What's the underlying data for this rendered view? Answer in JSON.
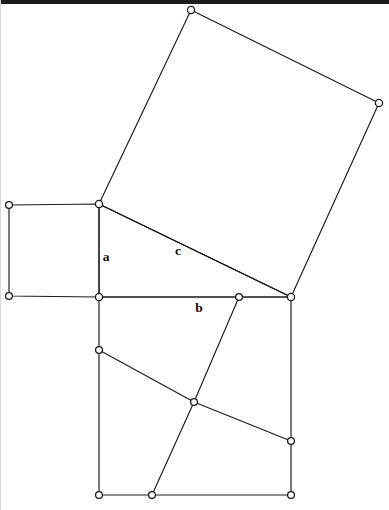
{
  "figure": {
    "canvas": {
      "width": 389,
      "height": 510,
      "background": "#ffffff"
    },
    "stroke_color": "#1b1b1b",
    "vertex_fill": "#ffffff",
    "label_color": "#101010",
    "scan_artifact": {
      "name": "top-dark-strip",
      "color": "#1d1d1d",
      "height": 4
    }
  },
  "labels": {
    "a": {
      "text": "a",
      "x": 106,
      "y": 258
    },
    "b": {
      "text": "b",
      "x": 199,
      "y": 309
    },
    "c": {
      "text": "c",
      "x": 178,
      "y": 252
    }
  },
  "points": {
    "T_apex": {
      "x": 99,
      "y": 204
    },
    "T_right_angle": {
      "x": 99,
      "y": 297
    },
    "T_far": {
      "x": 291,
      "y": 297
    },
    "A_tl": {
      "x": 9,
      "y": 205
    },
    "A_bl": {
      "x": 9,
      "y": 296
    },
    "C_top": {
      "x": 191,
      "y": 10
    },
    "C_right": {
      "x": 379,
      "y": 103
    },
    "B_bl": {
      "x": 99,
      "y": 495
    },
    "B_br": {
      "x": 291,
      "y": 495
    },
    "B_center": {
      "x": 194,
      "y": 402
    },
    "B_left_mid": {
      "x": 99,
      "y": 350
    },
    "B_top_mid": {
      "x": 239,
      "y": 297
    },
    "B_right_mid": {
      "x": 291,
      "y": 441
    },
    "B_bottom_mid": {
      "x": 152,
      "y": 495
    }
  },
  "shapes": {
    "square_a": {
      "name": "square-on-leg-a",
      "path": "M 9 205 L 99 204 L 99 297 L 9 296 Z"
    },
    "square_c": {
      "name": "square-on-hypotenuse-c",
      "path": "M 99 204 L 191 10 L 379 103 L 291 297 Z"
    },
    "square_b": {
      "name": "square-on-leg-b",
      "path": "M 99 297 L 291 297 L 291 495 L 99 495 Z"
    },
    "triangle": {
      "name": "right-triangle",
      "path": "M 99 204 L 99 297 L 291 297 Z"
    },
    "dissection_line_1": {
      "name": "perigal-cut-northwest-southeast",
      "path": "M 99 350 L 194 402 L 291 441"
    },
    "dissection_line_2": {
      "name": "perigal-cut-northeast-southwest",
      "path": "M 239 297 L 194 402 L 152 495"
    }
  },
  "vertex_markers": [
    {
      "name": "vertex-square-a-top-left",
      "x": 9,
      "y": 205,
      "r": 3.4
    },
    {
      "name": "vertex-square-a-bottom-left",
      "x": 9,
      "y": 296,
      "r": 3.4
    },
    {
      "name": "vertex-triangle-apex",
      "x": 99,
      "y": 204,
      "r": 3.6
    },
    {
      "name": "vertex-triangle-right-angle",
      "x": 99,
      "y": 297,
      "r": 3.6
    },
    {
      "name": "vertex-triangle-far",
      "x": 291,
      "y": 297,
      "r": 3.6
    },
    {
      "name": "vertex-square-c-top",
      "x": 191,
      "y": 10,
      "r": 3.6
    },
    {
      "name": "vertex-square-c-right",
      "x": 379,
      "y": 103,
      "r": 3.6
    },
    {
      "name": "vertex-square-b-bottom-left",
      "x": 99,
      "y": 495,
      "r": 3.4
    },
    {
      "name": "vertex-square-b-bottom-right",
      "x": 291,
      "y": 495,
      "r": 3.4
    },
    {
      "name": "vertex-dissection-center",
      "x": 194,
      "y": 402,
      "r": 3.4
    },
    {
      "name": "vertex-dissection-left-mid",
      "x": 99,
      "y": 350,
      "r": 3.4
    },
    {
      "name": "vertex-dissection-top-mid",
      "x": 239,
      "y": 297,
      "r": 3.4
    },
    {
      "name": "vertex-dissection-right-mid",
      "x": 291,
      "y": 441,
      "r": 3.4
    },
    {
      "name": "vertex-dissection-bottom-mid",
      "x": 152,
      "y": 495,
      "r": 3.4
    }
  ]
}
